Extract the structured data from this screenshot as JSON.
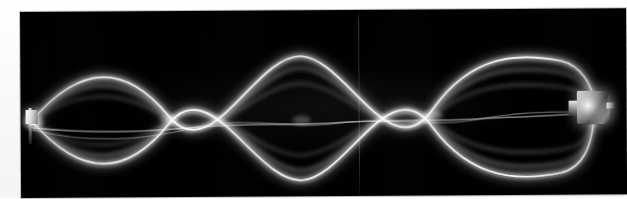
{
  "figure": {
    "name": "standing-wave-on-vibrating-string-photograph",
    "media_type": "photograph",
    "background_color": "#000000",
    "string_color": "#ffffff",
    "page_color": "#fcfcfc",
    "plate": {
      "x": 20,
      "y": 12,
      "width": 606,
      "height": 186,
      "rotation_deg": -0.35
    }
  },
  "wave": {
    "label": "standing wave",
    "harmonic_number": 4,
    "loop_count": 4,
    "antinode_count": 4,
    "node_count": 5,
    "axis_y": 115,
    "amplitude_px": 52,
    "left_end_x": 31,
    "right_end_x": 594,
    "nodes": [
      {
        "name": "node-fixed-left",
        "x": 31,
        "y": 121,
        "type": "fixed-end"
      },
      {
        "name": "node-1",
        "x": 168,
        "y": 117,
        "type": "interior"
      },
      {
        "name": "node-2",
        "x": 310,
        "y": 113,
        "type": "interior"
      },
      {
        "name": "node-3",
        "x": 452,
        "y": 110,
        "type": "interior"
      },
      {
        "name": "node-driver-right",
        "x": 594,
        "y": 107,
        "type": "driven-end"
      }
    ],
    "antinodes": [
      {
        "name": "antinode-1",
        "x": 100,
        "y_top": 75,
        "y_bottom": 168,
        "amplitude_px": 47
      },
      {
        "name": "antinode-2",
        "x": 240,
        "y_top": 58,
        "y_bottom": 172,
        "amplitude_px": 57
      },
      {
        "name": "antinode-3",
        "x": 381,
        "y_top": 62,
        "y_bottom": 166,
        "amplitude_px": 52
      },
      {
        "name": "antinode-4",
        "x": 523,
        "y_top": 60,
        "y_bottom": 164,
        "amplitude_px": 52
      }
    ]
  },
  "apparatus": {
    "left_anchor": {
      "label": "fixed string anchor",
      "x": 31,
      "y": 121
    },
    "right_driver": {
      "label": "mechanical vibrator clamp",
      "x": 594,
      "y": 107
    }
  },
  "artifacts": {
    "vertical_crease": {
      "label": "scan crease line",
      "x": 358
    },
    "grain": {
      "label": "film grain"
    },
    "vignette": {
      "label": "print vignette"
    }
  }
}
